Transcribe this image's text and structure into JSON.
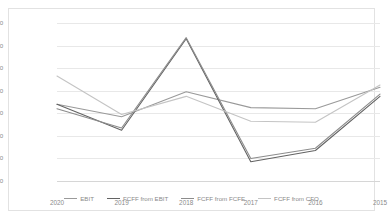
{
  "chart_data": {
    "type": "line",
    "title": "",
    "xlabel": "",
    "ylabel": "",
    "grid": true,
    "legend_position": "bottom",
    "categories": [
      "2020",
      "2019",
      "2018",
      "2017",
      "2016",
      "2015"
    ],
    "ylim": [
      30000,
      100000
    ],
    "yticks": [
      30000,
      40000,
      50000,
      60000,
      70000,
      80000,
      90000,
      100000
    ],
    "ytick_labels": [
      "$30,000",
      "$40,000",
      "$50,000",
      "$60,000",
      "$70,000",
      "$80,000",
      "$90,000",
      "$100,000"
    ],
    "series": [
      {
        "name": "EBIT",
        "color": "#9a9a9a",
        "values": [
          64000,
          58500,
          69500,
          62500,
          62000,
          71500
        ]
      },
      {
        "name": "FCFF from EBIT",
        "color": "#636363",
        "values": [
          64000,
          52500,
          93000,
          38500,
          43500,
          67500
        ]
      },
      {
        "name": "FCFF from FCFE",
        "color": "#8c8c8c",
        "values": [
          62000,
          53500,
          93500,
          40000,
          44500,
          68500
        ]
      },
      {
        "name": "FCFF from CFO",
        "color": "#c4c4c4",
        "values": [
          76500,
          59500,
          67500,
          56500,
          56000,
          72500
        ]
      }
    ]
  },
  "axis": {
    "ytick_labels": [
      "$100,000",
      "$90,000",
      "$80,000",
      "$70,000",
      "$60,000",
      "$50,000",
      "$40,000",
      "$30,000"
    ],
    "xtick_labels": [
      "2020",
      "2019",
      "2018",
      "2017",
      "2016",
      "2015"
    ]
  },
  "legend": {
    "items": [
      {
        "label": "EBIT",
        "color": "#9a9a9a"
      },
      {
        "label": "FCFF from EBIT",
        "color": "#636363"
      },
      {
        "label": "FCFF from FCFE",
        "color": "#8c8c8c"
      },
      {
        "label": "FCFF from CFO",
        "color": "#c4c4c4"
      }
    ]
  }
}
